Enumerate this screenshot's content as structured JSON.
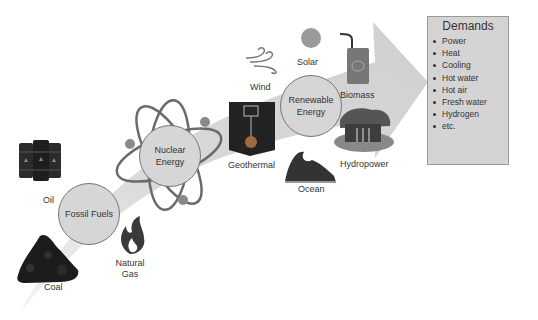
{
  "diagram": {
    "stages": [
      {
        "name": "Fossil Fuels",
        "line1": "Fossil Fuels",
        "line2": ""
      },
      {
        "name": "Nuclear Energy",
        "line1": "Nuclear",
        "line2": "Energy"
      },
      {
        "name": "Renewable Energy",
        "line1": "Renewable",
        "line2": "Energy"
      }
    ],
    "sources": {
      "oil": "Oil",
      "coal": "Coal",
      "natural_gas_1": "Natural",
      "natural_gas_2": "Gas",
      "wind": "Wind",
      "solar": "Solar",
      "biomass": "Biomass",
      "geothermal": "Geothermal",
      "hydropower": "Hydropower",
      "ocean": "Ocean"
    },
    "demands": {
      "title": "Demands",
      "items": [
        "Power",
        "Heat",
        "Cooling",
        "Hot water",
        "Hot air",
        "Fresh water",
        "Hydrogen",
        "etc."
      ]
    },
    "colors": {
      "arrow": "#d9d9d9",
      "circle_fill": "#d6d6d6",
      "demand_box": "#d4d4d4",
      "text": "#333333"
    }
  }
}
